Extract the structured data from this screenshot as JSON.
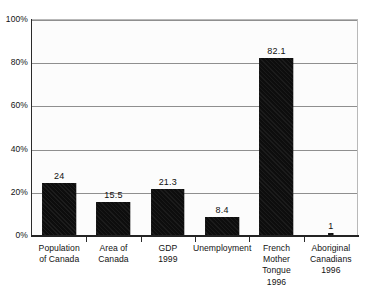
{
  "chart_data": {
    "type": "bar",
    "title": "",
    "subtitle": "",
    "xlabel": "",
    "ylabel": "",
    "ylim": [
      0,
      100
    ],
    "ytick_values": [
      0,
      20,
      40,
      60,
      80,
      100
    ],
    "ytick_labels": [
      "0%",
      "20%",
      "40%",
      "60%",
      "80%",
      "100%"
    ],
    "grid": true,
    "gridlines_at": [
      20,
      40,
      60,
      80,
      100
    ],
    "legend": null,
    "legend_position": "none",
    "categories": [
      "Population of Canada",
      "Area of Canada",
      "GDP 1999",
      "Unemployment",
      "French Mother Tongue 1996",
      "Aboriginal Canadians 1996"
    ],
    "category_label_lines": [
      [
        "Population",
        "of Canada"
      ],
      [
        "Area of",
        "Canada"
      ],
      [
        "GDP",
        "1999"
      ],
      [
        "Unemployment"
      ],
      [
        "French",
        "Mother",
        "Tongue",
        "1996"
      ],
      [
        "Aboriginal",
        "Canadians",
        "1996"
      ]
    ],
    "values": [
      24,
      15.5,
      21.3,
      8.4,
      82.1,
      1
    ],
    "value_labels": [
      "24",
      "15.5",
      "21.3",
      "8.4",
      "82.1",
      "1"
    ],
    "bar_color": "#111111",
    "plot_background": "#fcfcfc",
    "gridline_color": "#8f8f8f",
    "axis_color": "#232323",
    "bar_width_fraction": [
      0.62,
      0.62,
      0.62,
      0.62,
      0.62,
      0.1
    ]
  }
}
